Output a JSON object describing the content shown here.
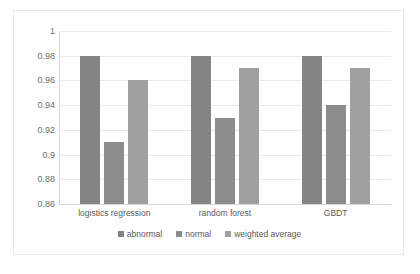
{
  "chart_data": {
    "type": "bar",
    "title": "",
    "subtitle": "",
    "xlabel": "",
    "ylabel": "",
    "categories": [
      "logistics regression",
      "random forest",
      "GBDT"
    ],
    "series": [
      {
        "name": "abnormal",
        "color": "#848484",
        "values": [
          0.98,
          0.98,
          0.98
        ]
      },
      {
        "name": "normal",
        "color": "#8c8c8c",
        "values": [
          0.91,
          0.93,
          0.94
        ]
      },
      {
        "name": "weighted average",
        "color": "#a0a0a0",
        "values": [
          0.96,
          0.97,
          0.97
        ]
      }
    ],
    "ylim": [
      0.86,
      1
    ],
    "yticks": [
      0.86,
      0.88,
      0.9,
      0.92,
      0.94,
      0.96,
      0.98,
      1
    ],
    "ytick_labels": [
      "0.86",
      "0.88",
      "0.9",
      "0.92",
      "0.94",
      "0.96",
      "0.98",
      "1"
    ],
    "grid": true,
    "grid_axis": "y",
    "legend_position": "bottom",
    "legend_entries": [
      "abnormal",
      "normal",
      "weighted average"
    ],
    "annotations": []
  }
}
